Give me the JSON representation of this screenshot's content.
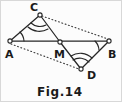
{
  "figure": {
    "caption": "Fig.14",
    "vertices": {
      "A": {
        "label": "A",
        "x": 9,
        "y": 41,
        "label_x": 5,
        "label_y": 58
      },
      "B": {
        "label": "B",
        "x": 110,
        "y": 41,
        "label_x": 108,
        "label_y": 58
      },
      "C": {
        "label": "C",
        "x": 40,
        "y": 13,
        "label_x": 30,
        "label_y": 11
      },
      "D": {
        "label": "D",
        "x": 81,
        "y": 70,
        "label_x": 87,
        "label_y": 79
      },
      "M": {
        "label": "M",
        "x": 60,
        "y": 42,
        "label_x": 54,
        "label_y": 58
      }
    },
    "solid_segments": [
      {
        "name": "segment-A-C",
        "from": "A",
        "to": "C"
      },
      {
        "name": "segment-A-B",
        "from": "A",
        "to": "B"
      },
      {
        "name": "segment-C-M",
        "from": "C",
        "to": "M"
      },
      {
        "name": "segment-M-D",
        "from": "M",
        "to": "D"
      },
      {
        "name": "segment-D-B",
        "from": "D",
        "to": "B"
      }
    ],
    "dotted_segments": [
      {
        "name": "dotted-C-B",
        "from": "C",
        "to": "B"
      },
      {
        "name": "dotted-A-D",
        "from": "A",
        "to": "D"
      }
    ],
    "angle_marks": [
      {
        "name": "angle-mark-A",
        "vertex": "A",
        "arcs": 1
      },
      {
        "name": "angle-mark-B",
        "vertex": "B",
        "arcs": 1
      },
      {
        "name": "angle-mark-C",
        "vertex": "C",
        "arcs": 2
      },
      {
        "name": "angle-mark-D",
        "vertex": "D",
        "arcs": 2
      }
    ],
    "colors": {
      "ink": "#262626",
      "paper": "#fcfcfc",
      "dotted": "#3a3a3a"
    }
  }
}
